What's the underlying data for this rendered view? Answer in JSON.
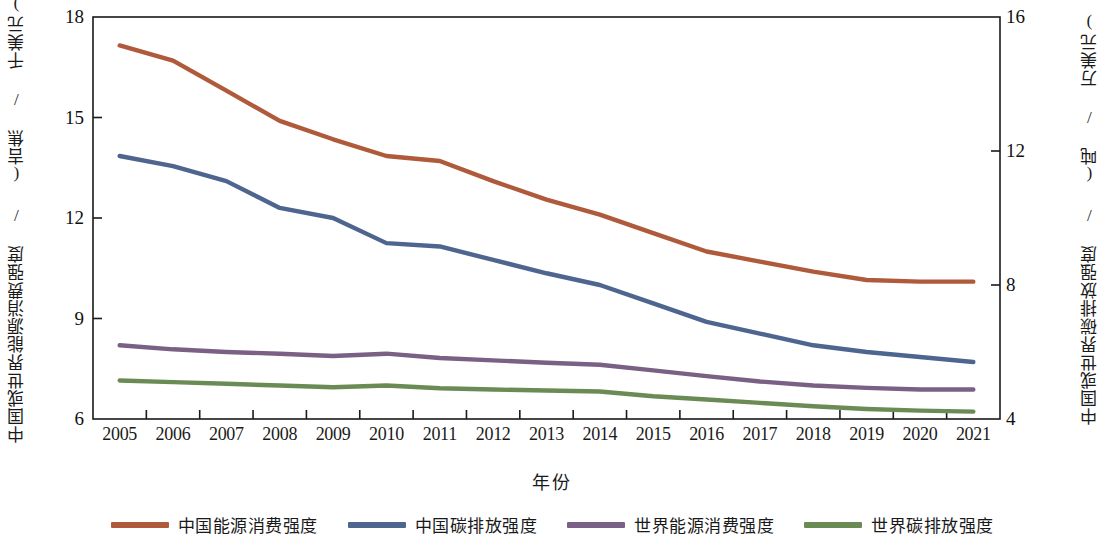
{
  "chart_data": {
    "type": "line",
    "title": "",
    "xlabel": "年份",
    "ylabel": "中国或世界能源消费强度 / (吉焦 / 千美元)",
    "ylabel_right": "中国或世界碳排放强度 / (吨 / 万美元)",
    "grid": false,
    "legend_position": "bottom",
    "x": [
      2005,
      2006,
      2007,
      2008,
      2009,
      2010,
      2011,
      2012,
      2013,
      2014,
      2015,
      2016,
      2017,
      2018,
      2019,
      2020,
      2021
    ],
    "categories": [
      "2005",
      "2006",
      "2007",
      "2008",
      "2009",
      "2010",
      "2011",
      "2012",
      "2013",
      "2014",
      "2015",
      "2016",
      "2017",
      "2018",
      "2019",
      "2020",
      "2021"
    ],
    "xlim": [
      2004.5,
      2021.5
    ],
    "ylim_left": [
      6,
      18
    ],
    "ylim_right": [
      4,
      16
    ],
    "yticks_left": [
      "18",
      "15",
      "12",
      "9",
      "6"
    ],
    "yticks_left_values": [
      18,
      15,
      12,
      9,
      6
    ],
    "yticks_right": [
      "16",
      "12",
      "8",
      "4"
    ],
    "yticks_right_values": [
      16,
      12,
      8,
      4
    ],
    "series": [
      {
        "name": "中国能源消费强度",
        "color": "#b05a3c",
        "axis": "left",
        "values": [
          17.15,
          16.7,
          15.8,
          14.9,
          14.35,
          13.85,
          13.7,
          13.1,
          12.55,
          12.1,
          11.55,
          11.0,
          10.7,
          10.4,
          10.15,
          10.1,
          10.1
        ]
      },
      {
        "name": "中国碳排放强度",
        "color": "#4e6590",
        "axis": "right",
        "values": [
          11.85,
          11.55,
          11.1,
          10.3,
          10.0,
          9.25,
          9.15,
          8.75,
          8.35,
          8.0,
          7.45,
          6.9,
          6.55,
          6.2,
          6.0,
          5.85,
          5.7
        ]
      },
      {
        "name": "世界能源消费强度",
        "color": "#7a6084",
        "axis": "left",
        "values": [
          8.2,
          8.08,
          8.0,
          7.95,
          7.88,
          7.95,
          7.82,
          7.75,
          7.68,
          7.62,
          7.45,
          7.28,
          7.12,
          7.0,
          6.93,
          6.88,
          6.88
        ]
      },
      {
        "name": "世界碳排放强度",
        "color": "#6b8b55",
        "axis": "right",
        "values": [
          5.15,
          5.1,
          5.05,
          5.0,
          4.95,
          5.0,
          4.92,
          4.88,
          4.85,
          4.82,
          4.68,
          4.58,
          4.48,
          4.38,
          4.3,
          4.25,
          4.22
        ]
      }
    ]
  },
  "legend": {
    "items": [
      {
        "label": "中国能源消费强度",
        "color": "#b05a3c"
      },
      {
        "label": "中国碳排放强度",
        "color": "#4e6590"
      },
      {
        "label": "世界能源消费强度",
        "color": "#7a6084"
      },
      {
        "label": "世界碳排放强度",
        "color": "#6b8b55"
      }
    ]
  },
  "axes": {
    "left_title": "中国或世界能源消费强度 / (吉焦 / 千美元)",
    "right_title": "中国或世界碳排放强度 / (吨 / 万美元)",
    "x_title": "年份"
  }
}
